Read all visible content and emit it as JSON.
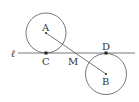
{
  "diagram": {
    "type": "geometry",
    "line_label": "ℓ",
    "points": {
      "A": {
        "label": "A",
        "x": 46,
        "y": 33
      },
      "B": {
        "label": "B",
        "x": 106,
        "y": 74
      },
      "C": {
        "label": "C",
        "x": 46,
        "y": 53
      },
      "D": {
        "label": "D",
        "x": 106,
        "y": 53
      },
      "M": {
        "label": "M",
        "x": 76,
        "y": 53
      }
    },
    "circles": [
      {
        "center": "A",
        "radius": 20
      },
      {
        "center": "B",
        "radius": 21
      }
    ],
    "stroke_color": "#555555"
  }
}
